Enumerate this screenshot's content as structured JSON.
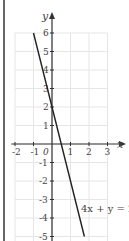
{
  "chart_data": {
    "type": "line",
    "title": "",
    "xlabel": "x",
    "ylabel": "y",
    "xlim": [
      -2,
      3
    ],
    "ylim": [
      -5,
      6
    ],
    "grid": true,
    "x_ticks": [
      "-2",
      "-1",
      "1",
      "2",
      "3"
    ],
    "y_ticks": [
      "6",
      "5",
      "4",
      "3",
      "2",
      "1",
      "-1",
      "-2",
      "-3",
      "-4",
      "-5"
    ],
    "origin_label": "0",
    "series": [
      {
        "name": "4x + y = 2",
        "equation": "y = 2 - 4x",
        "x": [
          -1,
          1.75
        ],
        "y": [
          6,
          -5
        ]
      }
    ],
    "annotations": [
      {
        "text": "4x + y = 2",
        "x": 1.5,
        "y": -3.4
      }
    ]
  },
  "colors": {
    "line": "#222222",
    "axis": "#333333",
    "grid": "#e6e6e6",
    "text": "#444444"
  }
}
